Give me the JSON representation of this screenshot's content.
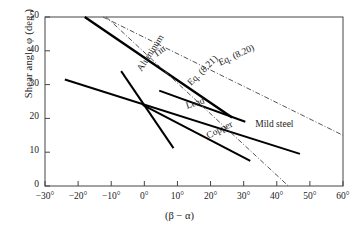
{
  "chart_data": {
    "type": "line",
    "title": "",
    "xlabel": "(β − α)",
    "ylabel": "Shear angle φ (deg.)",
    "xlim": [
      -30,
      60
    ],
    "ylim": [
      0,
      50
    ],
    "xticks": [
      -30,
      -20,
      -10,
      0,
      10,
      20,
      30,
      40,
      50,
      60
    ],
    "xticklabels": [
      "−30°",
      "−20°",
      "−10°",
      "0°",
      "10°",
      "20°",
      "30°",
      "40°",
      "50°",
      "60°"
    ],
    "yticks": [
      0,
      10,
      20,
      30,
      40,
      50
    ],
    "yticklabels": [
      "0",
      "10",
      "20",
      "30",
      "40",
      "50"
    ],
    "grid": false,
    "legend_position": "inline-annotations",
    "series": [
      {
        "name": "Tin",
        "style": "solid",
        "color": "#000000",
        "width": 2.4,
        "points": [
          [
            -18.0,
            50.0
          ],
          [
            26.5,
            20.3
          ]
        ]
      },
      {
        "name": "Aluminum",
        "style": "solid",
        "color": "#000000",
        "width": 2.0,
        "points": [
          [
            -7.0,
            34.0
          ],
          [
            8.8,
            11.2
          ]
        ]
      },
      {
        "name": "Mild steel",
        "style": "solid",
        "color": "#000000",
        "width": 2.0,
        "points": [
          [
            -24.0,
            31.5
          ],
          [
            47.0,
            9.5
          ]
        ]
      },
      {
        "name": "Lead",
        "style": "solid",
        "color": "#000000",
        "width": 2.0,
        "points": [
          [
            4.5,
            28.2
          ],
          [
            30.5,
            19.0
          ]
        ]
      },
      {
        "name": "Copper",
        "style": "solid",
        "color": "#000000",
        "width": 2.0,
        "points": [
          [
            -0.5,
            24.0
          ],
          [
            32.0,
            7.4
          ]
        ]
      },
      {
        "name": "Eq. (8.20)",
        "style": "dash-dot",
        "color": "#555555",
        "width": 1.0,
        "points": [
          [
            -12.5,
            50.0
          ],
          [
            60.0,
            15.0
          ]
        ]
      },
      {
        "name": "Eq. (8.21)",
        "style": "dash-dot",
        "color": "#555555",
        "width": 1.0,
        "points": [
          [
            -11.5,
            50.0
          ],
          [
            43.5,
            0.0
          ]
        ]
      }
    ],
    "annotations": [
      {
        "text": "Tin",
        "x": 3.0,
        "y": 38.5,
        "rotation": -36
      },
      {
        "text": "Aluminum",
        "x": -1.5,
        "y": 34.0,
        "rotation": -57
      },
      {
        "text": "Lead",
        "x": 12.5,
        "y": 23.5,
        "rotation": -18
      },
      {
        "text": "Copper",
        "x": 19.0,
        "y": 14.5,
        "rotation": -27
      },
      {
        "text": "Mild steel",
        "x": 33.5,
        "y": 18.0,
        "rotation": 0
      },
      {
        "text": "Eq. (8.20)",
        "x": 22.5,
        "y": 36.0,
        "rotation": -25
      },
      {
        "text": "Eq. (8.21)",
        "x": 13.5,
        "y": 30.0,
        "rotation": -45
      }
    ]
  }
}
